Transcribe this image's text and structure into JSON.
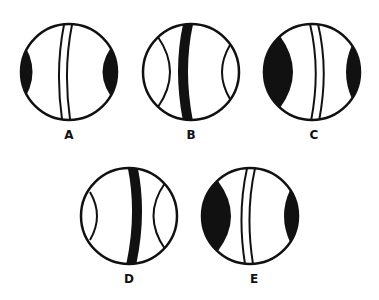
{
  "figure": {
    "options": [
      {
        "label": "A",
        "cx": 69,
        "cy": 72,
        "r": 48,
        "band": "double",
        "band_offset": 6,
        "left_shade": "filled",
        "right_shade": "filled",
        "left_depth": 18,
        "right_depth": 26
      },
      {
        "label": "B",
        "cx": 191,
        "cy": 72,
        "r": 48,
        "band": "solid",
        "band_offset": 0,
        "left_shade": "outline",
        "right_shade": "outline",
        "left_depth": 28,
        "right_depth": 14
      },
      {
        "label": "C",
        "cx": 312,
        "cy": 72,
        "r": 48,
        "band": "double",
        "band_offset": 4,
        "left_shade": "filled",
        "right_shade": "filled",
        "left_depth": 28,
        "right_depth": 14
      },
      {
        "label": "D",
        "cx": 129,
        "cy": 216,
        "r": 48,
        "band": "solid",
        "band_offset": 0,
        "left_shade": "outline",
        "right_shade": "outline",
        "left_depth": 16,
        "right_depth": 26
      },
      {
        "label": "E",
        "cx": 250,
        "cy": 216,
        "r": 48,
        "band": "double",
        "band_offset": -6,
        "left_shade": "filled",
        "right_shade": "filled",
        "left_depth": 28,
        "right_depth": 14
      }
    ],
    "labels": {
      "a": "A",
      "b": "B",
      "c": "C",
      "d": "D",
      "e": "E"
    },
    "colors": {
      "stroke": "#111111",
      "fill": "#111111",
      "background": "#ffffff"
    }
  }
}
